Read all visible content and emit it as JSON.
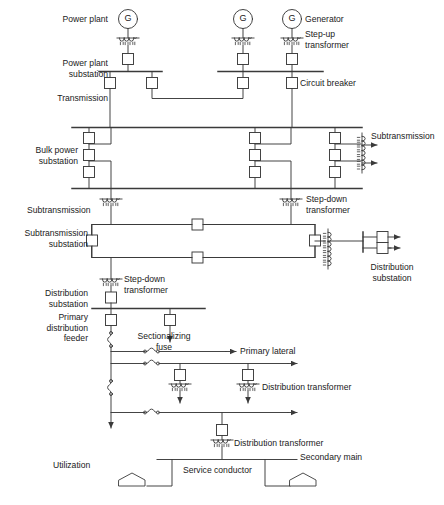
{
  "diagram": {
    "stroke_color": "#3a3a3a",
    "text_color": "#1a1a1a",
    "background": "#ffffff"
  },
  "level_labels": {
    "power_plant": "Power plant",
    "power_plant_substation": "Power plant\nsubstation",
    "transmission": "Transmission",
    "bulk_power_substation": "Bulk power\nsubstation",
    "subtransmission": "Subtransmission",
    "subtransmission_substation": "Subtransmission\nsubstation",
    "distribution_substation": "Distribution\nsubstation",
    "primary_distribution_feeder": "Primary\ndistribution\nfeeder",
    "utilization": "Utilization"
  },
  "component_labels": {
    "generator": "Generator",
    "step_up_transformer": "Step-up\ntransformer",
    "circuit_breaker": "Circuit breaker",
    "subtransmission_out": "Subtransmission",
    "step_down_transformer_bulk": "Step-down\ntransformer",
    "distribution_substation_right": "Distribution\nsubstation",
    "step_down_transformer_dist": "Step-down\ntransformer",
    "sectionalizing_fuse": "Sectionalizing\nfuse",
    "primary_lateral": "Primary lateral",
    "distribution_transformer_1": "Distribution transformer",
    "distribution_transformer_2": "Distribution transformer",
    "secondary_main": "Secondary main",
    "service_conductor": "Service conductor"
  },
  "symbols": {
    "generator_letter": "G",
    "generator_count": 3,
    "circuit_breaker_shape": "square",
    "transformer_shape": "coil",
    "fuse_shape": "s-curve",
    "house_shape": "pentagon",
    "arrow_shape": "filled-triangle"
  }
}
